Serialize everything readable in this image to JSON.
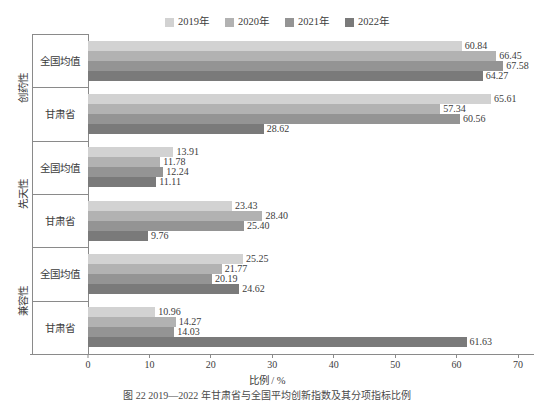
{
  "chart_data": {
    "type": "bar",
    "orientation": "horizontal",
    "title": "",
    "xlabel": "比例 / %",
    "ylabel": "",
    "xlim": [
      0,
      70
    ],
    "xticks": [
      0,
      10,
      20,
      30,
      40,
      50,
      60,
      70
    ],
    "grid": false,
    "legend_position": "top-center",
    "series": [
      {
        "name": "2019年",
        "color": "#d2d2d2"
      },
      {
        "name": "2020年",
        "color": "#b2b2b2"
      },
      {
        "name": "2021年",
        "color": "#949494"
      },
      {
        "name": "2022年",
        "color": "#7a7a7a"
      }
    ],
    "groups": [
      {
        "label": "创药性",
        "subgroups": [
          {
            "label": "全国均值",
            "values": [
              60.84,
              66.45,
              67.58,
              64.27
            ]
          },
          {
            "label": "甘肃省",
            "values": [
              65.61,
              57.34,
              60.56,
              28.62
            ]
          }
        ]
      },
      {
        "label": "先天性",
        "subgroups": [
          {
            "label": "全国均值",
            "values": [
              13.91,
              11.78,
              12.24,
              11.11
            ]
          },
          {
            "label": "甘肃省",
            "values": [
              23.43,
              28.4,
              25.4,
              9.76
            ]
          }
        ]
      },
      {
        "label": "兼容性",
        "subgroups": [
          {
            "label": "全国均值",
            "values": [
              25.25,
              21.77,
              20.19,
              24.62
            ]
          },
          {
            "label": "甘肃省",
            "values": [
              10.96,
              14.27,
              14.03,
              61.63
            ]
          }
        ]
      }
    ]
  },
  "caption": "图 22  2019—2022 年甘肃省与全国平均创新指数及其分项指标比例"
}
